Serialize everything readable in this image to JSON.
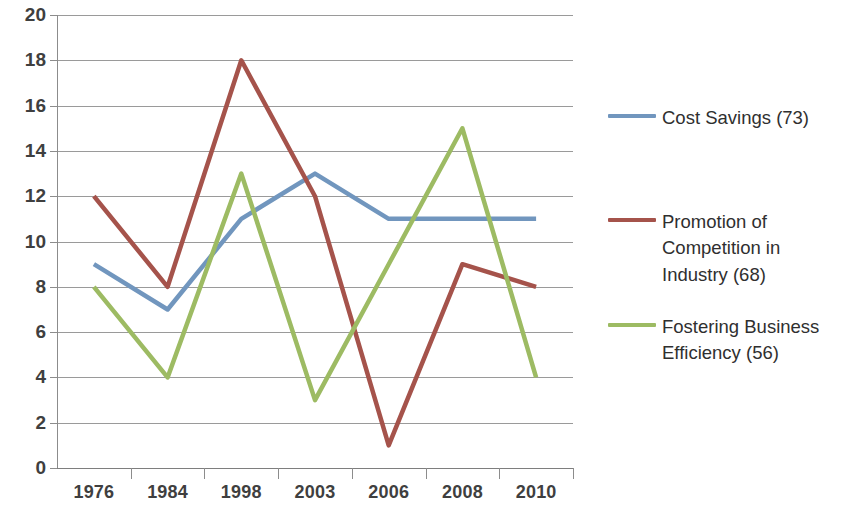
{
  "chart_data": {
    "type": "line",
    "title": "",
    "xlabel": "",
    "ylabel": "",
    "categories": [
      "1976",
      "1984",
      "1998",
      "2003",
      "2006",
      "2008",
      "2010"
    ],
    "ylim": [
      0,
      20
    ],
    "ytick_step": 2,
    "yticks": [
      "0",
      "2",
      "4",
      "6",
      "8",
      "10",
      "12",
      "14",
      "16",
      "18",
      "20"
    ],
    "grid": true,
    "legend_position": "right",
    "series": [
      {
        "name": "Cost Savings (73)",
        "color": "#7196BE",
        "values": [
          9,
          7,
          11,
          13,
          11,
          11,
          11
        ]
      },
      {
        "name": "Promotion of Competition in Industry (68)",
        "color": "#A5534B",
        "values": [
          12,
          8,
          18,
          12,
          1,
          9,
          8
        ]
      },
      {
        "name": "Fostering Business Efficiency (56)",
        "color": "#9DBB63",
        "values": [
          8,
          4,
          13,
          3,
          9,
          15,
          4
        ]
      }
    ]
  },
  "axes": {
    "y_axis_name": "value-axis",
    "x_axis_name": "category-axis"
  },
  "colors": {
    "gridline": "#9a9a9a",
    "axis": "#8c8c8c",
    "text": "#3f3f3f",
    "background": "#ffffff"
  }
}
